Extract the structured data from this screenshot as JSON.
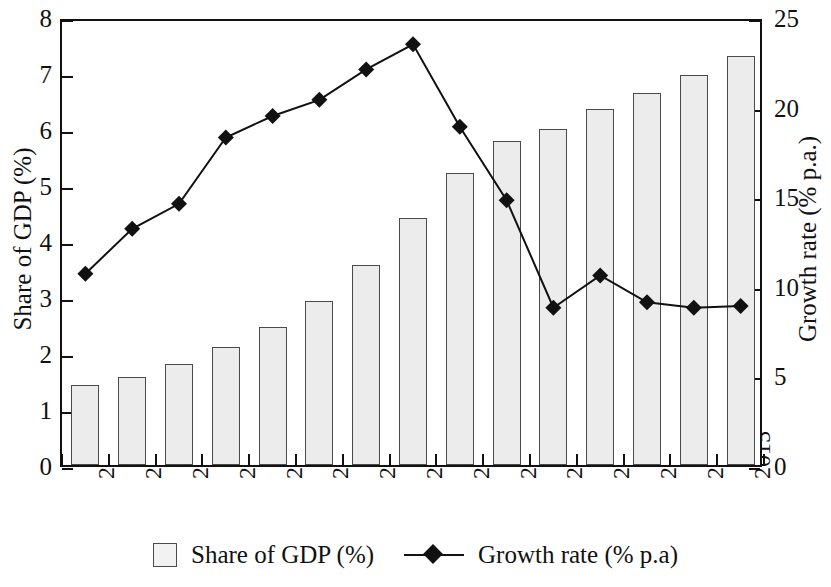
{
  "chart_data": {
    "type": "bar",
    "title": "",
    "subtitle": "",
    "xlabel": "",
    "ylabel": "Share of GDP (%)",
    "y2label": "Growth rate (% p.a.)",
    "categories": [
      "2001",
      "2002",
      "2003",
      "2004",
      "2005",
      "2006",
      "2007",
      "2008",
      "2009",
      "2010",
      "2011",
      "2012",
      "2013",
      "2014",
      "2015"
    ],
    "ylim": [
      0,
      8
    ],
    "y2lim": [
      0,
      25
    ],
    "yticks": [
      "0",
      "1",
      "2",
      "3",
      "4",
      "5",
      "6",
      "7",
      "8"
    ],
    "y2ticks": [
      "0",
      "5",
      "10",
      "15",
      "20",
      "25"
    ],
    "grid": false,
    "legend_position": "bottom",
    "series": [
      {
        "name": "Share of GDP (%)",
        "type": "bar",
        "axis": "left",
        "color": "#ececec",
        "edge_color": "#4a4a4a",
        "values": [
          1.42,
          1.58,
          1.8,
          2.1,
          2.47,
          2.93,
          3.57,
          4.41,
          5.21,
          5.78,
          6.0,
          6.35,
          6.64,
          6.96,
          7.3
        ]
      },
      {
        "name": "Growth rate (% p.a)",
        "type": "line",
        "axis": "right",
        "color": "#111111",
        "marker": "diamond",
        "values": [
          10.9,
          13.4,
          14.8,
          18.5,
          19.7,
          20.6,
          22.3,
          23.7,
          19.1,
          15.0,
          9.0,
          10.8,
          9.3,
          9.0,
          9.1
        ]
      }
    ]
  },
  "legend": {
    "items": [
      {
        "label": "Share of GDP (%)",
        "marker": "square-swatch"
      },
      {
        "label": "Growth rate (% p.a)",
        "marker": "line-diamond"
      }
    ]
  }
}
